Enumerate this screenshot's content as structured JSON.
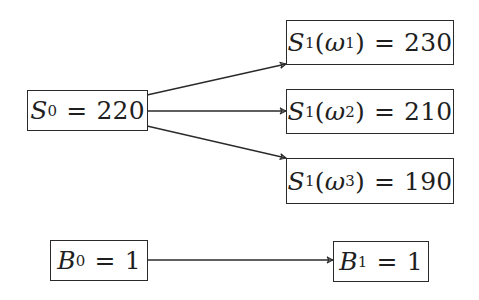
{
  "diagram": {
    "type": "one-period market model tree",
    "nodes": {
      "s0": {
        "symbol": "S",
        "sub": "0",
        "arg_symbol": "",
        "arg_sub": "",
        "value": "220",
        "label": "S_0 = 220"
      },
      "s1w1": {
        "symbol": "S",
        "sub": "1",
        "arg_symbol": "ω",
        "arg_sub": "1",
        "value": "230",
        "label": "S_1(ω_1) = 230"
      },
      "s1w2": {
        "symbol": "S",
        "sub": "1",
        "arg_symbol": "ω",
        "arg_sub": "2",
        "value": "210",
        "label": "S_1(ω_2) = 210"
      },
      "s1w3": {
        "symbol": "S",
        "sub": "1",
        "arg_symbol": "ω",
        "arg_sub": "3",
        "value": "190",
        "label": "S_1(ω_3) = 190"
      },
      "b0": {
        "symbol": "B",
        "sub": "0",
        "arg_symbol": "",
        "arg_sub": "",
        "value": "1",
        "label": "B_0 = 1"
      },
      "b1": {
        "symbol": "B",
        "sub": "1",
        "arg_symbol": "",
        "arg_sub": "",
        "value": "1",
        "label": "B_1 = 1"
      }
    },
    "edges": [
      {
        "from": "s0",
        "to": "s1w1"
      },
      {
        "from": "s0",
        "to": "s1w2"
      },
      {
        "from": "s0",
        "to": "s1w3"
      },
      {
        "from": "b0",
        "to": "b1"
      }
    ],
    "symbols": {
      "equals": "=",
      "open_paren": "(",
      "close_paren": ")"
    },
    "colors": {
      "stroke": "#2a2a2a",
      "text": "#1f1f1f",
      "background": "#ffffff"
    }
  }
}
